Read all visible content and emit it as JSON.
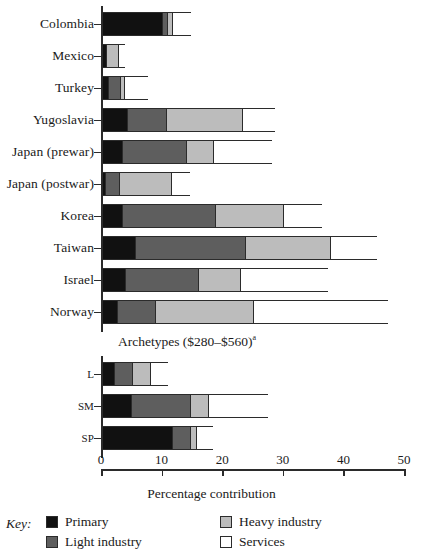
{
  "chart_data": {
    "type": "bar",
    "subtype": "stacked-horizontal",
    "title": "",
    "xlabel": "Percentage contribution",
    "ylabel": "",
    "xlim": [
      0,
      50
    ],
    "xticks": [
      0,
      10,
      20,
      30,
      40,
      50
    ],
    "grid": false,
    "legend_position": "bottom",
    "legend_title": "Key:",
    "series": [
      {
        "name": "Primary",
        "color": "#111111",
        "values": [
          9.9,
          0.7,
          1.0,
          4.1,
          3.3,
          0.5,
          3.3,
          5.4,
          3.8,
          2.5
        ]
      },
      {
        "name": "Light industry",
        "color": "#5e5e5e",
        "values": [
          0.9,
          0.0,
          2.0,
          6.5,
          10.6,
          2.3,
          15.3,
          18.2,
          12.1,
          6.3
        ]
      },
      {
        "name": "Heavy industry",
        "color": "#bcbcbc",
        "values": [
          0.7,
          2.0,
          0.7,
          12.5,
          4.4,
          8.6,
          11.2,
          14.0,
          6.8,
          16.2
        ]
      },
      {
        "name": "Services",
        "color": "#ffffff",
        "values": [
          3.3,
          1.3,
          4.0,
          5.6,
          9.9,
          3.3,
          6.6,
          7.9,
          14.7,
          22.3
        ]
      }
    ],
    "categories": [
      "Colombia",
      "Mexico",
      "Turkey",
      "Yugoslavia",
      "Japan (prewar)",
      "Japan (postwar)",
      "Korea",
      "Taiwan",
      "Israel",
      "Norway"
    ],
    "secondary_panel": {
      "label": "Archetypes ($280–$560)",
      "label_superscript": "a",
      "categories": [
        "L",
        "SM",
        "SP"
      ],
      "series": [
        {
          "name": "Primary",
          "color": "#111111",
          "values": [
            2.0,
            4.8,
            11.5
          ]
        },
        {
          "name": "Light industry",
          "color": "#5e5e5e",
          "values": [
            3.0,
            9.7,
            3.0
          ]
        },
        {
          "name": "Heavy industry",
          "color": "#bcbcbc",
          "values": [
            3.0,
            3.0,
            1.0
          ]
        },
        {
          "name": "Services",
          "color": "#ffffff",
          "values": [
            3.0,
            10.0,
            3.0
          ]
        }
      ]
    }
  },
  "axis": {
    "tick_labels": [
      "0",
      "10",
      "20",
      "30",
      "40",
      "50"
    ],
    "title": "Percentage contribution"
  },
  "legend": {
    "key_word": "Key:",
    "entries": [
      {
        "label": "Primary",
        "color": "#111111"
      },
      {
        "label": "Light industry",
        "color": "#5e5e5e"
      },
      {
        "label": "Heavy industry",
        "color": "#bcbcbc"
      },
      {
        "label": "Services",
        "color": "#ffffff"
      }
    ]
  }
}
